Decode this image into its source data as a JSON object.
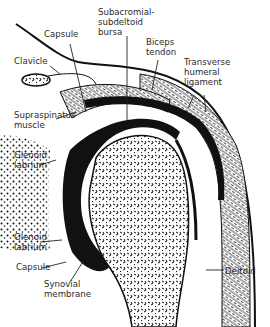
{
  "diagram": {
    "type": "anatomical cross-section",
    "colors": {
      "ink": "#111111",
      "background": "#ffffff"
    },
    "labels": [
      {
        "id": "capsule_top",
        "text": "Capsule",
        "x": 44,
        "y": 29
      },
      {
        "id": "subacromial_bursa",
        "text": "Subacromial-\nsubdeltoid\nbursa",
        "x": 98,
        "y": 7
      },
      {
        "id": "biceps_tendon",
        "text": "Biceps\ntendon",
        "x": 146,
        "y": 37
      },
      {
        "id": "clavicle",
        "text": "Clavicle",
        "x": 14,
        "y": 56
      },
      {
        "id": "transverse_ligament",
        "text": "Transverse\nhumeral\nligament",
        "x": 184,
        "y": 57
      },
      {
        "id": "supraspinatus",
        "text": "Supraspinatus\nmuscle",
        "x": 14,
        "y": 110
      },
      {
        "id": "glenoid_labrium_top",
        "text": "Glenoid\nlabrium",
        "x": 14,
        "y": 150
      },
      {
        "id": "glenoid_labrium_bottom",
        "text": "Glenoid\nlabrium",
        "x": 14,
        "y": 232
      },
      {
        "id": "capsule_bottom",
        "text": "Capsule",
        "x": 16,
        "y": 262
      },
      {
        "id": "synovial_membrane",
        "text": "Synovial\nmembrane",
        "x": 44,
        "y": 279
      },
      {
        "id": "deltoid",
        "text": "Deltoid",
        "x": 225,
        "y": 266
      }
    ]
  }
}
